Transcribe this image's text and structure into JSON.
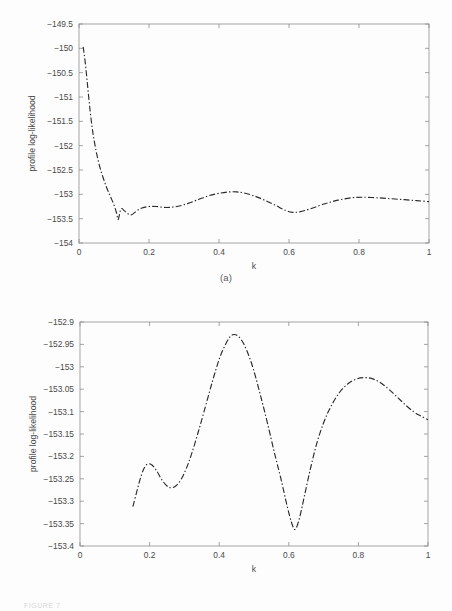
{
  "page": {
    "background": "#fdfdfd",
    "footnote_faint": "FIGURE 7"
  },
  "figures": [
    {
      "id": "a",
      "caption": "(a)"
    },
    {
      "id": "b",
      "caption": "(b)"
    }
  ],
  "chart_data": [
    {
      "type": "line",
      "panel": "(a)",
      "title": "",
      "xlabel": "k",
      "ylabel": "profile log-likelihood",
      "xlim": [
        0,
        1
      ],
      "ylim": [
        -154,
        -149.5
      ],
      "xticks": [
        0,
        0.2,
        0.4,
        0.6,
        0.8,
        1
      ],
      "xticklabels": [
        "0",
        "0.2",
        "0.4",
        "0.6",
        "0.8",
        "1"
      ],
      "yticks": [
        -154,
        -153.5,
        -153,
        -152.5,
        -152,
        -151.5,
        -151,
        -150.5,
        -150,
        -149.5
      ],
      "yticklabels": [
        "-154",
        "-153.5",
        "-153",
        "-152.5",
        "-152",
        "-151.5",
        "-151",
        "-150.5",
        "-150",
        "-149.5"
      ],
      "grid": false,
      "legend": null,
      "linestyle": "dashdot",
      "color": "#2b2b2b",
      "series": [
        {
          "name": "profile log-likelihood",
          "x": [
            0.012,
            0.018,
            0.025,
            0.032,
            0.04,
            0.05,
            0.06,
            0.07,
            0.08,
            0.09,
            0.1,
            0.108,
            0.112,
            0.12,
            0.13,
            0.14,
            0.15,
            0.165,
            0.18,
            0.2,
            0.22,
            0.25,
            0.28,
            0.31,
            0.34,
            0.37,
            0.4,
            0.43,
            0.45,
            0.47,
            0.5,
            0.53,
            0.56,
            0.59,
            0.61,
            0.63,
            0.66,
            0.7,
            0.74,
            0.78,
            0.81,
            0.85,
            0.89,
            0.93,
            0.965,
            1.0
          ],
          "y": [
            -149.97,
            -150.3,
            -150.8,
            -151.3,
            -151.75,
            -152.15,
            -152.45,
            -152.68,
            -152.88,
            -153.05,
            -153.22,
            -153.4,
            -153.52,
            -153.3,
            -153.34,
            -153.4,
            -153.42,
            -153.34,
            -153.28,
            -153.25,
            -153.25,
            -153.27,
            -153.25,
            -153.19,
            -153.11,
            -153.03,
            -152.98,
            -152.95,
            -152.95,
            -152.97,
            -153.03,
            -153.12,
            -153.22,
            -153.33,
            -153.37,
            -153.36,
            -153.3,
            -153.2,
            -153.12,
            -153.07,
            -153.06,
            -153.07,
            -153.09,
            -153.11,
            -153.13,
            -153.15
          ]
        }
      ]
    },
    {
      "type": "line",
      "panel": "(b)",
      "title": "",
      "xlabel": "k",
      "ylabel": "profile log-likelihood",
      "xlim": [
        0,
        1
      ],
      "ylim": [
        -153.4,
        -152.9
      ],
      "xticks": [
        0,
        0.2,
        0.4,
        0.6,
        0.8,
        1
      ],
      "xticklabels": [
        "0",
        "0.2",
        "0.4",
        "0.6",
        "0.8",
        "1"
      ],
      "yticks": [
        -153.4,
        -153.35,
        -153.3,
        -153.25,
        -153.2,
        -153.15,
        -153.1,
        -153.05,
        -153,
        -152.95,
        -152.9
      ],
      "yticklabels": [
        "-153.4",
        "-153.35",
        "-153.3",
        "-153.25",
        "-153.2",
        "-153.15",
        "-153.1",
        "-153.05",
        "-153",
        "-152.95",
        "-152.9"
      ],
      "grid": false,
      "legend": null,
      "linestyle": "dashdot",
      "color": "#2b2b2b",
      "series": [
        {
          "name": "profile log-likelihood",
          "x": [
            0.152,
            0.162,
            0.172,
            0.182,
            0.192,
            0.205,
            0.22,
            0.235,
            0.25,
            0.262,
            0.275,
            0.29,
            0.305,
            0.32,
            0.34,
            0.36,
            0.38,
            0.4,
            0.415,
            0.43,
            0.442,
            0.455,
            0.47,
            0.485,
            0.5,
            0.52,
            0.54,
            0.56,
            0.578,
            0.595,
            0.608,
            0.618,
            0.63,
            0.645,
            0.662,
            0.68,
            0.7,
            0.72,
            0.745,
            0.77,
            0.795,
            0.82,
            0.845,
            0.868,
            0.89,
            0.912,
            0.935,
            0.958,
            0.98,
            1.0
          ],
          "y": [
            -153.312,
            -153.282,
            -153.253,
            -153.23,
            -153.218,
            -153.218,
            -153.232,
            -153.252,
            -153.266,
            -153.27,
            -153.266,
            -153.252,
            -153.228,
            -153.196,
            -153.145,
            -153.09,
            -153.034,
            -152.983,
            -152.955,
            -152.934,
            -152.928,
            -152.932,
            -152.948,
            -152.975,
            -153.01,
            -153.068,
            -153.13,
            -153.196,
            -153.252,
            -153.31,
            -153.348,
            -153.363,
            -153.34,
            -153.288,
            -153.228,
            -153.172,
            -153.125,
            -153.09,
            -153.058,
            -153.038,
            -153.027,
            -153.024,
            -153.028,
            -153.038,
            -153.052,
            -153.068,
            -153.085,
            -153.1,
            -153.11,
            -153.118
          ]
        }
      ]
    }
  ]
}
